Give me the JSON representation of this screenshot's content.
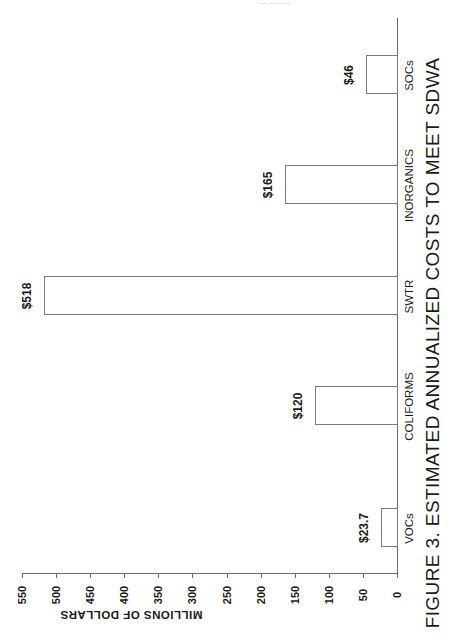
{
  "chart_data": {
    "type": "bar",
    "orientation": "rotated-90",
    "title": "FIGURE 3.  ESTIMATED ANNUALIZED COSTS TO MEET SDWA",
    "xlabel": "",
    "ylabel": "MILLIONS OF DOLLARS",
    "categories": [
      "VOCs",
      "COLIFORMS",
      "SWTR",
      "INORGANICS",
      "SOCs"
    ],
    "values": [
      23.7,
      120,
      518,
      165,
      46
    ],
    "value_labels": [
      "$23.7",
      "$120",
      "$518",
      "$165",
      "$46"
    ],
    "ylim": [
      0,
      550
    ],
    "yticks": [
      "0",
      "50",
      "100",
      "150",
      "200",
      "250",
      "300",
      "350",
      "400",
      "450",
      "500",
      "550"
    ],
    "grid": false,
    "legend": null
  },
  "page": {
    "faint_header": "— — —"
  }
}
